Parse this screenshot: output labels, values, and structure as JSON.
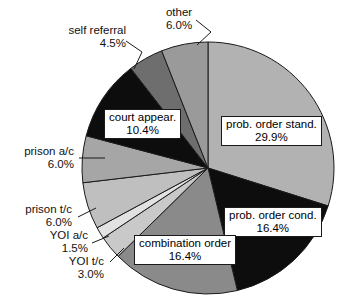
{
  "chart_data": {
    "type": "pie",
    "title": "",
    "subtitle": "",
    "xlabel": "",
    "ylabel": "",
    "legend_position": "none",
    "grid": false,
    "units": "percent",
    "start_angle_deg": 0,
    "direction": "clockwise",
    "categories": [
      "prob. order stand.",
      "prob. order cond.",
      "combination order",
      "YOI t/c",
      "YOI a/c",
      "prison t/c",
      "prison a/c",
      "court appear.",
      "self referral",
      "other"
    ],
    "values": [
      29.9,
      16.4,
      16.4,
      3.0,
      1.5,
      6.0,
      6.0,
      10.4,
      4.5,
      6.0
    ],
    "value_labels": [
      "29.9%",
      "16.4%",
      "16.4%",
      "3.0%",
      "1.5%",
      "6.0%",
      "6.0%",
      "10.4%",
      "4.5%",
      "6.0%"
    ],
    "colors": [
      "#b2b2b2",
      "#0d0d0d",
      "#8a8a8a",
      "#c9c9c9",
      "#e2e2e2",
      "#bfbfbf",
      "#a6a6a6",
      "#0d0d0d",
      "#6e6e6e",
      "#9a9a9a"
    ],
    "slice_border_color": "#1a1a1a",
    "label_style": [
      "boxed",
      "boxed",
      "boxed",
      "leader",
      "leader",
      "leader",
      "leader",
      "boxed",
      "leader",
      "leader"
    ]
  },
  "slices": [
    {
      "label": "prob. order stand.",
      "percent": "29.9%"
    },
    {
      "label": "prob. order cond.",
      "percent": "16.4%"
    },
    {
      "label": "combination order",
      "percent": "16.4%"
    },
    {
      "label": "YOI t/c",
      "percent": "3.0%"
    },
    {
      "label": "YOI a/c",
      "percent": "1.5%"
    },
    {
      "label": "prison t/c",
      "percent": "6.0%"
    },
    {
      "label": "prison a/c",
      "percent": "6.0%"
    },
    {
      "label": "court appear.",
      "percent": "10.4%"
    },
    {
      "label": "self referral",
      "percent": "4.5%"
    },
    {
      "label": "other",
      "percent": "6.0%"
    }
  ]
}
